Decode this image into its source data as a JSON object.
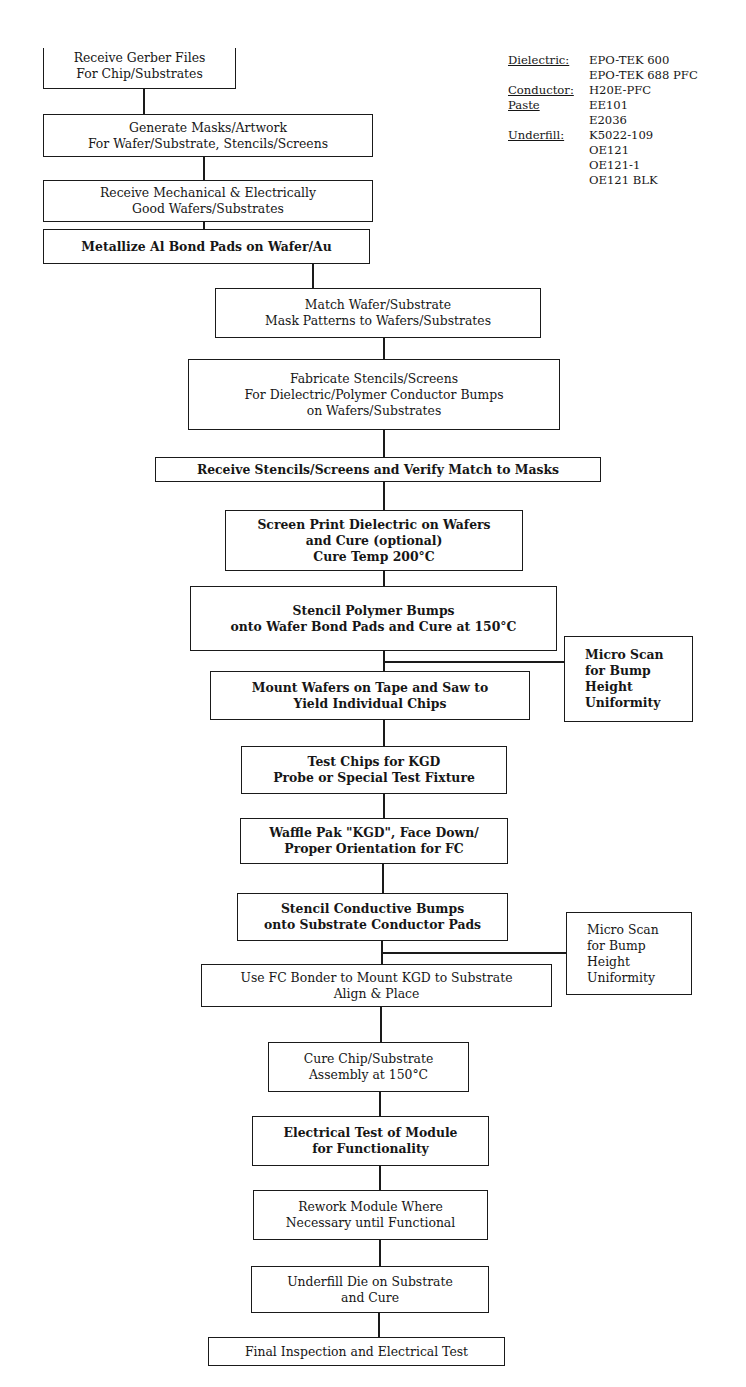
{
  "legend": {
    "rows": [
      {
        "key": "Dielectric:",
        "value": "EPO-TEK 600"
      },
      {
        "key": "",
        "value": "EPO-TEK 688 PFC"
      },
      {
        "key": "Conductor:",
        "value": "H20E-PFC"
      },
      {
        "key": "Paste",
        "value": "EE101"
      },
      {
        "key": "",
        "value": "E2036"
      },
      {
        "key": "Underfill:",
        "value": "K5022-109"
      },
      {
        "key": "",
        "value": "OE121"
      },
      {
        "key": "",
        "value": "OE121-1"
      },
      {
        "key": "",
        "value": "OE121 BLK"
      }
    ]
  },
  "steps": [
    {
      "id": "receive-gerber",
      "lines": [
        "Receive Gerber Files",
        "For Chip/Substrates"
      ]
    },
    {
      "id": "generate-masks",
      "lines": [
        "Generate Masks/Artwork",
        "For Wafer/Substrate, Stencils/Screens"
      ]
    },
    {
      "id": "receive-wafers",
      "lines": [
        "Receive Mechanical & Electrically",
        "Good Wafers/Substrates"
      ]
    },
    {
      "id": "metallize-pads",
      "lines": [
        "Metallize Al Bond Pads on Wafer/Au"
      ]
    },
    {
      "id": "match-masks",
      "lines": [
        "Match Wafer/Substrate",
        "Mask Patterns to Wafers/Substrates"
      ]
    },
    {
      "id": "fabricate-stencils",
      "lines": [
        "Fabricate Stencils/Screens",
        "For Dielectric/Polymer Conductor Bumps",
        "on Wafers/Substrates"
      ]
    },
    {
      "id": "receive-stencils",
      "lines": [
        "Receive Stencils/Screens and Verify Match to Masks"
      ]
    },
    {
      "id": "screen-print",
      "lines": [
        "Screen Print Dielectric on Wafers",
        "and Cure (optional)",
        "Cure Temp 200°C"
      ]
    },
    {
      "id": "stencil-polymer",
      "lines": [
        "Stencil Polymer Bumps",
        "onto Wafer Bond Pads and Cure at 150°C"
      ]
    },
    {
      "id": "mount-wafers",
      "lines": [
        "Mount Wafers on Tape and Saw to",
        "Yield Individual Chips"
      ]
    },
    {
      "id": "test-chips",
      "lines": [
        "Test Chips for KGD",
        "Probe or Special Test Fixture"
      ]
    },
    {
      "id": "waffle-pak",
      "lines": [
        "Waffle Pak \"KGD\", Face Down/",
        "Proper Orientation for FC"
      ]
    },
    {
      "id": "stencil-conductive",
      "lines": [
        "Stencil Conductive Bumps",
        "onto Substrate Conductor Pads"
      ]
    },
    {
      "id": "fc-bonder",
      "lines": [
        "Use FC Bonder to Mount KGD to Substrate",
        "Align & Place"
      ]
    },
    {
      "id": "cure-assembly",
      "lines": [
        "Cure Chip/Substrate",
        "Assembly at 150°C"
      ]
    },
    {
      "id": "electrical-test",
      "lines": [
        "Electrical Test of Module",
        "for Functionality"
      ]
    },
    {
      "id": "rework-module",
      "lines": [
        "Rework Module Where",
        "Necessary until Functional"
      ]
    },
    {
      "id": "underfill-die",
      "lines": [
        "Underfill Die on Substrate",
        "and Cure"
      ]
    },
    {
      "id": "final-inspection",
      "lines": [
        "Final Inspection and Electrical Test"
      ]
    }
  ],
  "side_steps": [
    {
      "id": "micro-scan-1",
      "lines": [
        "Micro Scan",
        "for Bump",
        "Height",
        "Uniformity"
      ]
    },
    {
      "id": "micro-scan-2",
      "lines": [
        "Micro Scan",
        "for Bump",
        "Height",
        "Uniformity"
      ]
    }
  ]
}
